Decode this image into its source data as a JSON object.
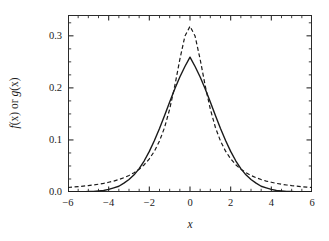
{
  "figure": {
    "background_color": "#ffffff",
    "frame_color": "#2b2b2b"
  },
  "axes": {
    "x_title": "x",
    "y_title_parts": {
      "f": "f",
      "x1": "(x)",
      "or": " or ",
      "g": "g",
      "x2": "(x)"
    },
    "y_title_plain": "f(x) or g(x)",
    "x_tick_labels": [
      "−6",
      "−4",
      "−2",
      "0",
      "2",
      "4",
      "6"
    ],
    "x_tick_values": [
      -6,
      -4,
      -2,
      0,
      2,
      4,
      6
    ],
    "y_tick_labels": [
      "0.0",
      "0.1",
      "0.2",
      "0.3"
    ],
    "y_tick_values": [
      0.0,
      0.1,
      0.2,
      0.3
    ],
    "x_minor_step": 0.5,
    "y_minor_step": 0.025,
    "tick_direction": "in",
    "frame": "box"
  },
  "chart_data": {
    "type": "line",
    "title": "",
    "xlabel": "x",
    "ylabel": "f(x) or g(x)",
    "xlim": [
      -6,
      6
    ],
    "ylim": [
      0.0,
      0.34
    ],
    "grid": false,
    "legend_position": "none",
    "xticks": [
      -6,
      -4,
      -2,
      0,
      2,
      4,
      6
    ],
    "yticks": [
      0.0,
      0.1,
      0.2,
      0.3
    ],
    "x": [
      -6.0,
      -5.75,
      -5.5,
      -5.25,
      -5.0,
      -4.75,
      -4.5,
      -4.25,
      -4.0,
      -3.75,
      -3.5,
      -3.25,
      -3.0,
      -2.75,
      -2.5,
      -2.25,
      -2.0,
      -1.75,
      -1.5,
      -1.25,
      -1.0,
      -0.75,
      -0.5,
      -0.25,
      0.0,
      0.25,
      0.5,
      0.75,
      1.0,
      1.25,
      1.5,
      1.75,
      2.0,
      2.25,
      2.5,
      2.75,
      3.0,
      3.25,
      3.5,
      3.75,
      4.0,
      4.25,
      4.5,
      4.75,
      5.0,
      5.25,
      5.5,
      5.75,
      6.0
    ],
    "series": [
      {
        "name": "f(x)",
        "style": "solid",
        "color": "#1a1a1a",
        "linewidth": 1.4,
        "peak_value": 0.259,
        "peak_x": 0.0,
        "description": "Gaussian, sigma = 1.54",
        "values": [
          0.0,
          0.0,
          0.0,
          0.0,
          0.001,
          0.001,
          0.002,
          0.003,
          0.005,
          0.008,
          0.011,
          0.017,
          0.024,
          0.033,
          0.045,
          0.06,
          0.078,
          0.099,
          0.122,
          0.147,
          0.173,
          0.198,
          0.221,
          0.241,
          0.259,
          0.241,
          0.221,
          0.198,
          0.173,
          0.147,
          0.122,
          0.099,
          0.078,
          0.06,
          0.045,
          0.033,
          0.024,
          0.017,
          0.011,
          0.008,
          0.005,
          0.003,
          0.002,
          0.001,
          0.001,
          0.0,
          0.0,
          0.0,
          0.0
        ]
      },
      {
        "name": "g(x)",
        "style": "dashed",
        "color": "#1a1a1a",
        "linewidth": 1.2,
        "peak_value": 0.318,
        "peak_x": 0.0,
        "description": "Lorentzian (Cauchy), gamma = 1.0",
        "values": [
          0.0086,
          0.0094,
          0.0103,
          0.0113,
          0.0122,
          0.0135,
          0.0149,
          0.0166,
          0.0187,
          0.021,
          0.0239,
          0.0274,
          0.0318,
          0.0371,
          0.0438,
          0.0524,
          0.0637,
          0.0784,
          0.0979,
          0.1239,
          0.1592,
          0.2037,
          0.2546,
          0.2995,
          0.3183,
          0.2995,
          0.2546,
          0.2037,
          0.1592,
          0.1239,
          0.0979,
          0.0784,
          0.0637,
          0.0524,
          0.0438,
          0.0371,
          0.0318,
          0.0274,
          0.0239,
          0.021,
          0.0187,
          0.0166,
          0.0149,
          0.0135,
          0.0122,
          0.0113,
          0.0103,
          0.0094,
          0.0086
        ]
      }
    ]
  }
}
